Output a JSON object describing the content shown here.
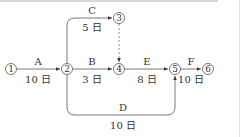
{
  "diagram": {
    "type": "arrow-network",
    "nodes": [
      {
        "id": "1",
        "label": "①"
      },
      {
        "id": "2",
        "label": "②"
      },
      {
        "id": "3",
        "label": "③"
      },
      {
        "id": "4",
        "label": "④"
      },
      {
        "id": "5",
        "label": "⑤"
      },
      {
        "id": "6",
        "label": "⑥"
      }
    ],
    "activities": [
      {
        "name": "A",
        "duration": "10 日",
        "from": "1",
        "to": "2"
      },
      {
        "name": "B",
        "duration": "3 日",
        "from": "2",
        "to": "4"
      },
      {
        "name": "C",
        "duration": "5 日",
        "from": "2",
        "to": "3"
      },
      {
        "name": "D",
        "duration": "10 日",
        "from": "2",
        "to": "5"
      },
      {
        "name": "E",
        "duration": "8 日",
        "from": "4",
        "to": "5"
      },
      {
        "name": "F",
        "duration": "10 日",
        "from": "5",
        "to": "6"
      }
    ],
    "dummy": {
      "from": "3",
      "to": "4",
      "style": "dashed"
    }
  }
}
